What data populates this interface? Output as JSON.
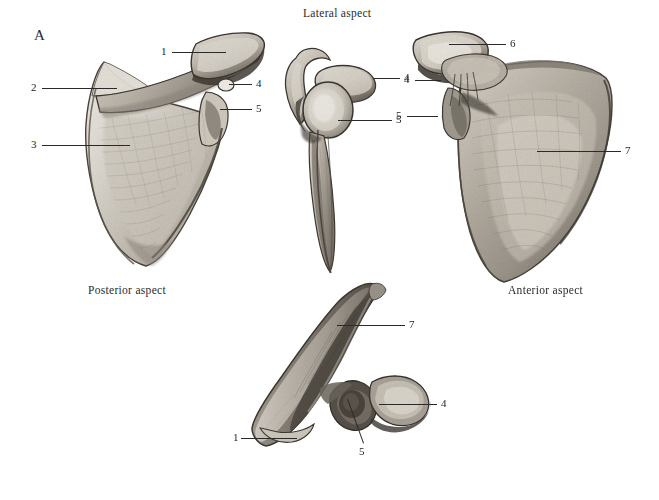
{
  "plate": {
    "panel_letter": "A",
    "background_color": "#ffffff",
    "ink_color": "#2a2a2a"
  },
  "captions": [
    {
      "name": "caption-lateral",
      "text": "Lateral aspect",
      "x": 303,
      "y": 7,
      "align": "left"
    },
    {
      "name": "caption-posterior",
      "text": "Posterior aspect",
      "x": 88,
      "y": 284,
      "align": "left"
    },
    {
      "name": "caption-anterior",
      "text": "Anterior aspect",
      "x": 508,
      "y": 284,
      "align": "left"
    }
  ],
  "figures": [
    {
      "name": "scapula-posterior-view",
      "aspect": "Posterior aspect",
      "labels": [
        "1",
        "2",
        "3",
        "4",
        "5"
      ]
    },
    {
      "name": "scapula-lateral-view",
      "aspect": "Lateral aspect",
      "labels": [
        "4",
        "5"
      ]
    },
    {
      "name": "scapula-anterior-view",
      "aspect": "Anterior aspect",
      "labels": [
        "4",
        "5",
        "6",
        "7"
      ]
    },
    {
      "name": "scapula-superior-view",
      "aspect": "",
      "labels": [
        "1",
        "4",
        "5",
        "7"
      ]
    }
  ],
  "labels": [
    {
      "name": "label-1-posterior",
      "text": "1",
      "x": 161,
      "y": 47,
      "leader": {
        "x1": 172,
        "y1": 52,
        "x2": 226,
        "y2": 52
      }
    },
    {
      "name": "label-2-posterior",
      "text": "2",
      "x": 31,
      "y": 82,
      "leader": {
        "x1": 42,
        "y1": 88,
        "x2": 117,
        "y2": 88
      }
    },
    {
      "name": "label-3-posterior",
      "text": "3",
      "x": 31,
      "y": 139,
      "leader": {
        "x1": 42,
        "y1": 145,
        "x2": 130,
        "y2": 145
      }
    },
    {
      "name": "label-4-posterior",
      "text": "4",
      "x": 256,
      "y": 78,
      "leader": {
        "x1": 229,
        "y1": 84,
        "x2": 252,
        "y2": 84
      }
    },
    {
      "name": "label-5-posterior",
      "text": "5",
      "x": 256,
      "y": 103,
      "leader": {
        "x1": 220,
        "y1": 109,
        "x2": 252,
        "y2": 109
      }
    },
    {
      "name": "label-4-lateral",
      "text": "4",
      "x": 404,
      "y": 72,
      "leader": {
        "x1": 374,
        "y1": 78,
        "x2": 400,
        "y2": 78
      }
    },
    {
      "name": "label-5-lateral",
      "text": "5",
      "x": 396,
      "y": 114,
      "leader": {
        "x1": 338,
        "y1": 120,
        "x2": 392,
        "y2": 120
      }
    },
    {
      "name": "label-6-anterior",
      "text": "6",
      "x": 510,
      "y": 38,
      "leader": {
        "x1": 449,
        "y1": 44,
        "x2": 506,
        "y2": 44
      }
    },
    {
      "name": "label-4-anterior",
      "text": "4",
      "x": 404,
      "y": 74,
      "leader": {
        "x1": 415,
        "y1": 80,
        "x2": 441,
        "y2": 80
      }
    },
    {
      "name": "label-5-anterior",
      "text": "5",
      "x": 396,
      "y": 110,
      "leader": {
        "x1": 407,
        "y1": 116,
        "x2": 438,
        "y2": 116
      }
    },
    {
      "name": "label-7-anterior",
      "text": "7",
      "x": 625,
      "y": 145,
      "leader": {
        "x1": 537,
        "y1": 151,
        "x2": 621,
        "y2": 151
      }
    },
    {
      "name": "label-7-superior",
      "text": "7",
      "x": 409,
      "y": 319,
      "leader": {
        "x1": 337,
        "y1": 325,
        "x2": 405,
        "y2": 325
      }
    },
    {
      "name": "label-4-superior",
      "text": "4",
      "x": 441,
      "y": 398,
      "leader": {
        "x1": 379,
        "y1": 404,
        "x2": 437,
        "y2": 404
      }
    },
    {
      "name": "label-1-superior",
      "text": "1",
      "x": 233,
      "y": 432,
      "leader": {
        "x1": 241,
        "y1": 438,
        "x2": 297,
        "y2": 438
      }
    },
    {
      "name": "label-5-superior",
      "text": "5",
      "x": 359,
      "y": 446,
      "leader_diagonal": {
        "x1": 348,
        "y1": 399,
        "x2": 364,
        "y2": 443
      }
    }
  ]
}
